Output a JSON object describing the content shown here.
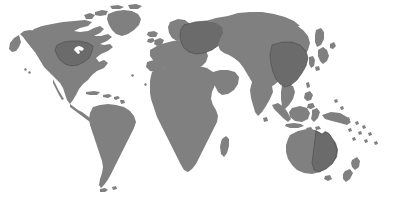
{
  "map": {
    "title": "World Map",
    "projection": "equirectangular",
    "canvas": {
      "width": 394,
      "height": 203
    },
    "colors": {
      "background": "#ffffff",
      "land": "#808080",
      "land_highlight": "#6b6b6b",
      "border": "#4a4a4a",
      "inland_water": "#ffffff"
    },
    "legend_visible": false,
    "labels_visible": false,
    "graticule_visible": false,
    "regions": [
      {
        "name": "north-america",
        "label": "North America",
        "highlighted": false
      },
      {
        "name": "united-states",
        "label": "United States",
        "highlighted": true
      },
      {
        "name": "greenland",
        "label": "Greenland",
        "highlighted": false
      },
      {
        "name": "south-america",
        "label": "South America",
        "highlighted": false
      },
      {
        "name": "africa",
        "label": "Africa",
        "highlighted": false
      },
      {
        "name": "europe",
        "label": "Europe",
        "highlighted": false
      },
      {
        "name": "western-russia",
        "label": "Western Russia",
        "highlighted": true
      },
      {
        "name": "asia",
        "label": "Asia",
        "highlighted": false
      },
      {
        "name": "china",
        "label": "China",
        "highlighted": true
      },
      {
        "name": "india",
        "label": "India",
        "highlighted": false
      },
      {
        "name": "indonesia",
        "label": "Indonesia",
        "highlighted": false
      },
      {
        "name": "australia",
        "label": "Australia",
        "highlighted": false
      },
      {
        "name": "eastern-australia",
        "label": "Eastern Australia",
        "highlighted": true
      },
      {
        "name": "new-zealand",
        "label": "New Zealand",
        "highlighted": false
      },
      {
        "name": "madagascar",
        "label": "Madagascar",
        "highlighted": false
      },
      {
        "name": "japan",
        "label": "Japan",
        "highlighted": false
      },
      {
        "name": "great-lakes",
        "label": "Great Lakes",
        "highlighted": false
      },
      {
        "name": "caribbean",
        "label": "Caribbean Islands",
        "highlighted": false
      },
      {
        "name": "pacific-islands",
        "label": "Pacific Islands",
        "highlighted": false
      }
    ]
  }
}
